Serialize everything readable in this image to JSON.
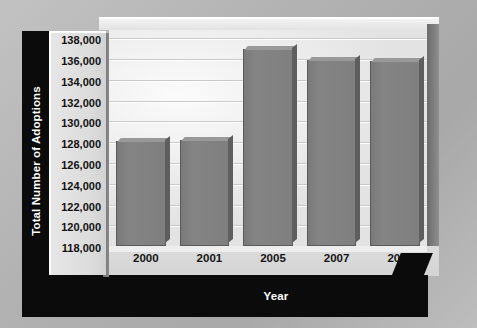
{
  "chart_data": {
    "type": "bar",
    "title": "",
    "xlabel": "Year",
    "ylabel": "Total Number of Adoptions",
    "categories": [
      "2000",
      "2001",
      "2005",
      "2007",
      "2008"
    ],
    "values": [
      128100,
      128200,
      137000,
      135900,
      135800
    ],
    "ylim": [
      118000,
      138800
    ],
    "ytick_values": [
      118000,
      120000,
      122000,
      124000,
      126000,
      128000,
      130000,
      132000,
      134000,
      136000,
      138000
    ],
    "ytick_labels": [
      "118,000",
      "120,000",
      "122,000",
      "124,000",
      "126,000",
      "128,000",
      "130,000",
      "132,000",
      "134,000",
      "136,000",
      "138,000"
    ],
    "grid": true,
    "legend": "none",
    "bar_color": "#807f80",
    "bar_edge_color": "#5b5a5b",
    "axis_title_color": "#ffffff",
    "axis_band_color": "#0b0b0b",
    "plot_background": "#f0f0f0",
    "page_background": "#b3b3b3"
  }
}
